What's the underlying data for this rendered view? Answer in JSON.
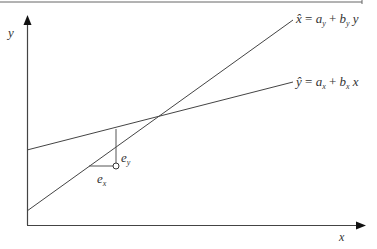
{
  "diagram": {
    "type": "regression-lines",
    "axes": {
      "x_label": "x",
      "y_label": "y"
    },
    "lines": [
      {
        "name": "x-hat-regression",
        "equation_lhs": "x̂",
        "eq": "=",
        "a": "a",
        "a_sub": "y",
        "plus": "+",
        "b": "b",
        "b_sub": "y",
        "var": "y"
      },
      {
        "name": "y-hat-regression",
        "equation_lhs": "ŷ",
        "eq": "=",
        "a": "a",
        "a_sub": "x",
        "plus": "+",
        "b": "b",
        "b_sub": "x",
        "var": "x"
      }
    ],
    "residuals": {
      "e_y": {
        "base": "e",
        "sub": "y"
      },
      "e_x": {
        "base": "e",
        "sub": "x"
      }
    },
    "colors": {
      "line": "#444444",
      "text": "#333333",
      "background": "#ffffff"
    }
  }
}
